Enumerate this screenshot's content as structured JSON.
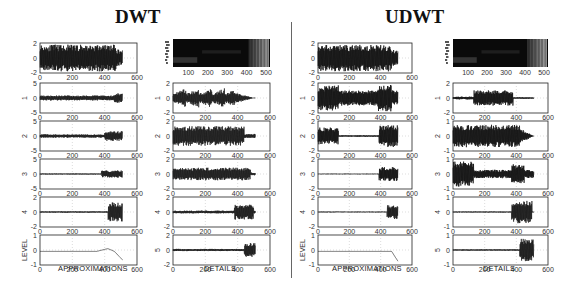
{
  "titles": {
    "left": "DWT",
    "right": "UDWT"
  },
  "chart_data": [
    {
      "type": "line",
      "title": "DWT",
      "columns": [
        {
          "xlabel": "APPROXIMATIONS",
          "ylabel_last": "LEVEL",
          "panels": [
            {
              "label": "",
              "ylim": [
                -2,
                2
              ],
              "yticks": [
                -2,
                0,
                2
              ],
              "xlim": [
                0,
                600
              ],
              "xticks": [
                0,
                200,
                400,
                600
              ],
              "desc": "original signal, dense oscillation between -2 and 2 up to ~480, then drops"
            },
            {
              "label": "1",
              "ylim": [
                -5,
                5
              ],
              "yticks": [
                -5,
                0,
                5
              ],
              "xlim": [
                0,
                600
              ],
              "xticks": [
                0,
                200,
                400,
                600
              ],
              "desc": "small oscillation around 0, spike near 480"
            },
            {
              "label": "2",
              "ylim": [
                -5,
                5
              ],
              "yticks": [
                -5,
                0,
                5
              ],
              "xlim": [
                0,
                600
              ],
              "xticks": [
                0,
                200,
                400,
                600
              ],
              "desc": "noise around 0 early, bursts near 400-500"
            },
            {
              "label": "3",
              "ylim": [
                -5,
                5
              ],
              "yticks": [
                -5,
                0,
                5
              ],
              "xlim": [
                0,
                600
              ],
              "xticks": [
                0,
                200,
                400,
                600
              ],
              "desc": "near-zero, small bursts 400-500"
            },
            {
              "label": "4",
              "ylim": [
                -2,
                2
              ],
              "yticks": [
                -2,
                0,
                2
              ],
              "xlim": [
                0,
                600
              ],
              "xticks": [
                0,
                200,
                400,
                600
              ],
              "desc": "flat near 0, swing to +1/-2 around 450-500"
            },
            {
              "label": "LEVEL",
              "ylim": [
                -1,
                1
              ],
              "yticks": [
                -1,
                0,
                1
              ],
              "xlim": [
                0,
                600
              ],
              "xticks": [
                0,
                200,
                400,
                600
              ],
              "desc": "near -0.1, bump near 400, decline to -0.7 at 500"
            }
          ]
        },
        {
          "xlabel": "DETAILS",
          "panels": [
            {
              "label": "scalogram",
              "type": "heatmap",
              "xlim": [
                0,
                500
              ],
              "xticks": [
                100,
                200,
                300,
                400,
                500
              ],
              "desc": "dark scalogram, bright stripes at 400-500"
            },
            {
              "label": "1",
              "ylim": [
                -2,
                2
              ],
              "yticks": [
                -2,
                0,
                2
              ],
              "xlim": [
                0,
                600
              ],
              "xticks": [
                0,
                200,
                400,
                600
              ],
              "desc": "growing oscillation bursts up to ~380 then decays"
            },
            {
              "label": "2",
              "ylim": [
                -2,
                2
              ],
              "yticks": [
                -2,
                0,
                2
              ],
              "xlim": [
                0,
                600
              ],
              "xticks": [
                0,
                200,
                400,
                600
              ],
              "desc": "dense oscillation ±1.5 until ~450"
            },
            {
              "label": "3",
              "ylim": [
                -2,
                2
              ],
              "yticks": [
                -2,
                0,
                2
              ],
              "xlim": [
                0,
                600
              ],
              "xticks": [
                0,
                200,
                400,
                600
              ],
              "desc": "dense oscillation ±1 until ~500"
            },
            {
              "label": "4",
              "ylim": [
                -2,
                2
              ],
              "yticks": [
                -2,
                0,
                2
              ],
              "xlim": [
                0,
                600
              ],
              "xticks": [
                0,
                200,
                400,
                600
              ],
              "desc": "small wiggles, burst 380-500"
            },
            {
              "label": "5",
              "ylim": [
                -2,
                2
              ],
              "yticks": [
                -2,
                0,
                2
              ],
              "xlim": [
                0,
                600
              ],
              "xticks": [
                0,
                200,
                400,
                600
              ],
              "desc": "small wiggles, spikes 450-510"
            }
          ]
        }
      ]
    },
    {
      "type": "line",
      "title": "UDWT",
      "columns": [
        {
          "xlabel": "APPROXIMATIONS",
          "ylabel_last": "LEVEL",
          "panels": [
            {
              "label": "",
              "ylim": [
                -2,
                2
              ],
              "yticks": [
                -2,
                0,
                2
              ],
              "xlim": [
                0,
                600
              ],
              "xticks": [
                0,
                200,
                400,
                600
              ],
              "desc": "original signal"
            },
            {
              "label": "1",
              "ylim": [
                -2,
                2
              ],
              "yticks": [
                -2,
                0,
                2
              ],
              "xlim": [
                0,
                600
              ],
              "xticks": [
                0,
                200,
                400,
                600
              ],
              "desc": "dense oscillation, larger before 130, spikes near 450"
            },
            {
              "label": "2",
              "ylim": [
                -2,
                2
              ],
              "yticks": [
                -2,
                0,
                2
              ],
              "xlim": [
                0,
                600
              ],
              "xticks": [
                0,
                200,
                400,
                600
              ],
              "desc": "burst 0-130, flat, burst 400-500"
            },
            {
              "label": "3",
              "ylim": [
                -2,
                2
              ],
              "yticks": [
                -2,
                0,
                2
              ],
              "xlim": [
                0,
                600
              ],
              "xticks": [
                0,
                200,
                400,
                600
              ],
              "desc": "flat, burst 400-500 dropping to -2"
            },
            {
              "label": "4",
              "ylim": [
                -2,
                2
              ],
              "yticks": [
                -2,
                0,
                2
              ],
              "xlim": [
                0,
                600
              ],
              "xticks": [
                0,
                200,
                400,
                600
              ],
              "desc": "flat, dip near 480"
            },
            {
              "label": "LEVEL",
              "ylim": [
                -1,
                1
              ],
              "yticks": [
                -1,
                0,
                1
              ],
              "xlim": [
                0,
                600
              ],
              "xticks": [
                0,
                200,
                400,
                600
              ],
              "desc": "near -0.1, drop to -0.8 near 490"
            }
          ]
        },
        {
          "xlabel": "DETAILS",
          "panels": [
            {
              "label": "scalogram",
              "type": "heatmap",
              "xlim": [
                0,
                500
              ],
              "xticks": [
                100,
                200,
                300,
                400,
                500
              ],
              "desc": "dark scalogram, bright stripes at 400-500"
            },
            {
              "label": "1",
              "ylim": [
                -2,
                2
              ],
              "yticks": [
                -2,
                0,
                2
              ],
              "xlim": [
                0,
                600
              ],
              "xticks": [
                0,
                200,
                400,
                600
              ],
              "desc": "small until 130, dense block ±1 130-380"
            },
            {
              "label": "2",
              "ylim": [
                -1,
                1
              ],
              "yticks": [
                -1,
                0,
                1
              ],
              "xlim": [
                0,
                600
              ],
              "xticks": [
                0,
                200,
                400,
                600
              ],
              "desc": "dense oscillation ±0.8 until ~420"
            },
            {
              "label": "3",
              "ylim": [
                -1,
                1
              ],
              "yticks": [
                -1,
                0,
                1
              ],
              "xlim": [
                0,
                600
              ],
              "xticks": [
                0,
                200,
                400,
                600
              ],
              "desc": "large block 0-130, smaller, burst 370-450"
            },
            {
              "label": "4",
              "ylim": [
                -1,
                1
              ],
              "yticks": [
                -1,
                0,
                1
              ],
              "xlim": [
                0,
                600
              ],
              "xticks": [
                0,
                200,
                400,
                600
              ],
              "desc": "flat, burst 370-500"
            },
            {
              "label": "5",
              "ylim": [
                -1,
                1
              ],
              "yticks": [
                -1,
                0,
                1
              ],
              "xlim": [
                0,
                600
              ],
              "xticks": [
                0,
                200,
                400,
                600
              ],
              "desc": "flat, oscillation 420-510"
            }
          ]
        }
      ]
    }
  ]
}
